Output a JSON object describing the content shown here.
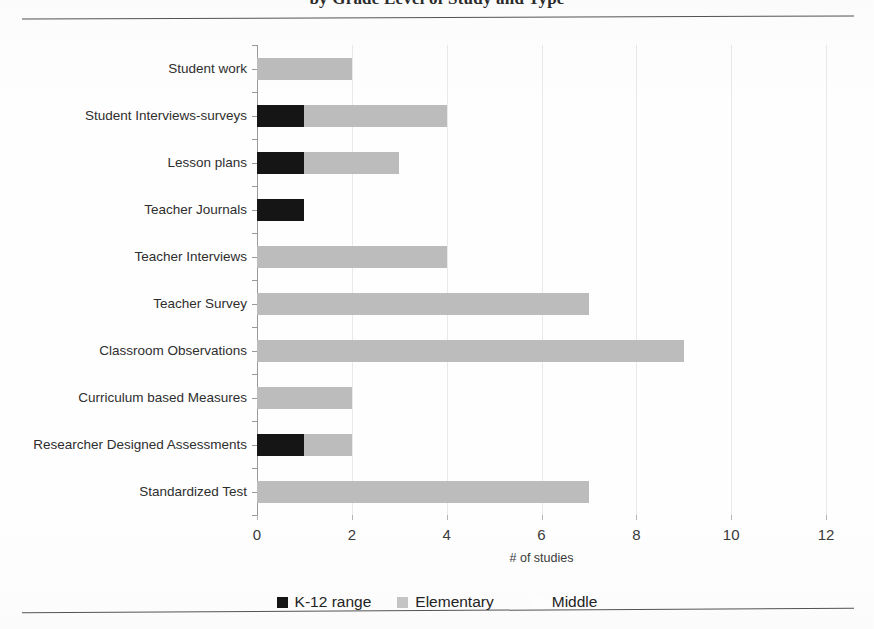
{
  "figure": {
    "title": "by Grade Level of Study and Type",
    "top_rule": "horizontal-rule",
    "bottom_rule": "horizontal-rule"
  },
  "chart_data": {
    "type": "bar",
    "orientation": "horizontal",
    "stacked": true,
    "title": "by Grade Level of Study and Type",
    "xlabel": "# of studies",
    "ylabel": "",
    "xlim": [
      0,
      12
    ],
    "xticks": [
      0,
      2,
      4,
      6,
      8,
      10,
      12
    ],
    "xtick_labels": [
      "0",
      "2",
      "4",
      "6",
      "8",
      "10",
      "12"
    ],
    "grid": "vertical",
    "legend_position": "bottom",
    "categories": [
      "Student work",
      "Student Interviews-surveys",
      "Lesson plans",
      "Teacher Journals",
      "Teacher Interviews",
      "Teacher Survey",
      "Classroom Observations",
      "Curriculum based Measures",
      "Researcher Designed Assessments",
      "Standardized Test"
    ],
    "series": [
      {
        "name": "K-12 range",
        "color": "#151515",
        "values": [
          0,
          1,
          1,
          1,
          0,
          0,
          0,
          0,
          1,
          0
        ]
      },
      {
        "name": "Elementary",
        "color": "#bcbcbc",
        "values": [
          2,
          3,
          2,
          0,
          4,
          7,
          9,
          2,
          1,
          7
        ]
      },
      {
        "name": "Middle",
        "color": "#ffffff",
        "values": [
          0,
          0,
          0,
          0,
          0,
          0,
          0,
          0,
          0,
          0
        ]
      }
    ],
    "totals": [
      2,
      4,
      3,
      1,
      4,
      7,
      9,
      2,
      2,
      7
    ]
  },
  "legend": {
    "items": [
      {
        "label": "K-12 range",
        "swatch": "k12"
      },
      {
        "label": "Elementary",
        "swatch": "elem"
      },
      {
        "label": "Middle",
        "swatch": "mid"
      }
    ]
  }
}
